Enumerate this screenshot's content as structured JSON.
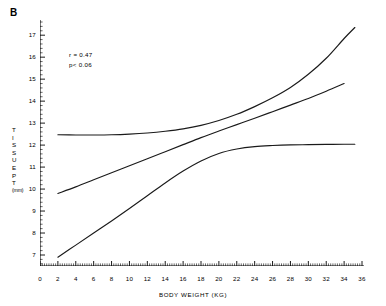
{
  "panel": {
    "label": "B"
  },
  "annotation": {
    "correlation": "r = 0.47",
    "pvalue": "p< 0.06"
  },
  "axes": {
    "xlabel": "BODY WEIGHT  (KG)",
    "ylabel_text": "TISSUE PT (mm)",
    "ylabel_chars": [
      "T",
      "I",
      "S",
      "S",
      "U",
      "E",
      "",
      "P",
      "T"
    ],
    "ylabel_unit": "(mm)",
    "xticks": [
      "0",
      "2",
      "4",
      "6",
      "8",
      "10",
      "12",
      "14",
      "16",
      "18",
      "20",
      "22",
      "24",
      "26",
      "28",
      "30",
      "32",
      "34",
      "36"
    ],
    "yticks": [
      "17",
      "16",
      "15",
      "14",
      "13",
      "12",
      "11",
      "10",
      "9",
      "8",
      "7"
    ]
  },
  "style": {
    "line_color": "#1a1a1a",
    "axis_color": "#000000",
    "background": "#ffffff"
  },
  "chart_data": {
    "type": "line",
    "title": "",
    "subtitle": "",
    "xlabel": "BODY WEIGHT  (KG)",
    "ylabel": "TISSUE PT (mm)",
    "xlim": [
      0,
      36
    ],
    "ylim": [
      6.5,
      17.6
    ],
    "xticks": [
      0,
      2,
      4,
      6,
      8,
      10,
      12,
      14,
      16,
      18,
      20,
      22,
      24,
      26,
      28,
      30,
      32,
      34,
      36
    ],
    "yticks": [
      7,
      8,
      9,
      10,
      11,
      12,
      13,
      14,
      15,
      16,
      17
    ],
    "grid": false,
    "legend": "none",
    "annotations": [
      {
        "text": "r = 0.47",
        "x": 3.2,
        "y": 15.7
      },
      {
        "text": "p< 0.06",
        "x": 3.2,
        "y": 15.25
      },
      {
        "text": "B",
        "x": -4.0,
        "y": 18.6
      }
    ],
    "series": [
      {
        "name": "upper band",
        "x": [
          2.0,
          4.0,
          6.0,
          8.0,
          10.0,
          12.0,
          14.0,
          16.0,
          18.0,
          20.0,
          22.0,
          24.0,
          26.0,
          28.0,
          30.0,
          32.0,
          34.0,
          35.2
        ],
        "y": [
          12.47,
          12.46,
          12.46,
          12.47,
          12.5,
          12.55,
          12.63,
          12.74,
          12.9,
          13.12,
          13.4,
          13.75,
          14.15,
          14.62,
          15.22,
          15.95,
          16.85,
          17.35
        ]
      },
      {
        "name": "middle band",
        "x": [
          2.0,
          4.0,
          6.0,
          8.0,
          10.0,
          12.0,
          14.0,
          16.0,
          18.0,
          20.0,
          22.0,
          24.0,
          26.0,
          28.0,
          30.0,
          32.0,
          34.0
        ],
        "y": [
          9.8,
          10.1,
          10.42,
          10.74,
          11.06,
          11.38,
          11.7,
          12.02,
          12.34,
          12.64,
          12.93,
          13.22,
          13.52,
          13.82,
          14.12,
          14.45,
          14.8
        ]
      },
      {
        "name": "lower band",
        "x": [
          2.0,
          4.0,
          6.0,
          8.0,
          10.0,
          12.0,
          14.0,
          16.0,
          18.0,
          20.0,
          22.0,
          24.0,
          26.0,
          28.0,
          30.0,
          32.0,
          34.0,
          35.2
        ],
        "y": [
          6.9,
          7.45,
          8.0,
          8.55,
          9.12,
          9.7,
          10.28,
          10.82,
          11.28,
          11.62,
          11.82,
          11.93,
          11.98,
          12.01,
          12.02,
          12.03,
          12.04,
          12.04
        ]
      }
    ]
  }
}
